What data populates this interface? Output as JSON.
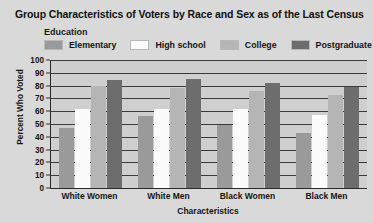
{
  "chart_data": {
    "type": "bar",
    "title": "Group Characteristics of Voters by Race and Sex as of the Last Census",
    "xlabel": "Characteristics",
    "ylabel": "Percent Who Voted",
    "ylim": [
      0,
      100
    ],
    "ytick_step": 10,
    "yticks": [
      "100",
      "90",
      "80",
      "70",
      "60",
      "50",
      "40",
      "30",
      "20",
      "10",
      "0"
    ],
    "grid": true,
    "legend_title": "Education",
    "legend_position": "top",
    "categories": [
      "White Women",
      "White Men",
      "Black Women",
      "Black Men"
    ],
    "series": [
      {
        "name": "Elementary",
        "color": "#9a9a9a",
        "values": [
          47,
          56,
          49,
          43
        ]
      },
      {
        "name": "High school",
        "color": "#fbfbfb",
        "values": [
          62,
          62,
          62,
          57
        ]
      },
      {
        "name": "College",
        "color": "#b5b5b5",
        "values": [
          80,
          78,
          76,
          73
        ]
      },
      {
        "name": "Postgraduate",
        "color": "#6d6d6d",
        "values": [
          84,
          85,
          82,
          79
        ]
      }
    ]
  },
  "colors": {
    "background": "#d9d9d9",
    "plot_background": "#cfcfcf",
    "axis": "#2a2a2a",
    "gridline": "#3a3a3a",
    "text": "#151515"
  }
}
